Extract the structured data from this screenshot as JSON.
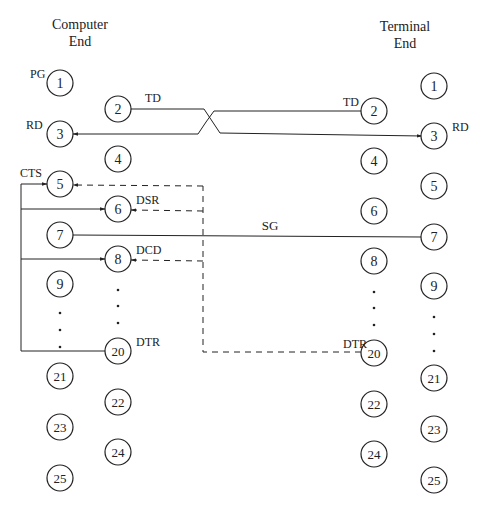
{
  "headers": {
    "computer": [
      "Computer",
      "End"
    ],
    "terminal": [
      "Terminal",
      "End"
    ]
  },
  "computer_pins": [
    {
      "n": "1",
      "x": 60,
      "y": 83,
      "label": "PG",
      "lx": 30,
      "ly": 78
    },
    {
      "n": "2",
      "x": 118,
      "y": 109,
      "label": "TD",
      "lx": 145,
      "ly": 102
    },
    {
      "n": "3",
      "x": 60,
      "y": 134,
      "label": "RD",
      "lx": 26,
      "ly": 129
    },
    {
      "n": "4",
      "x": 118,
      "y": 159,
      "label": "",
      "lx": 0,
      "ly": 0
    },
    {
      "n": "5",
      "x": 60,
      "y": 184,
      "label": "CTS",
      "lx": 20,
      "ly": 177
    },
    {
      "n": "6",
      "x": 118,
      "y": 209,
      "label": "DSR",
      "lx": 136,
      "ly": 204
    },
    {
      "n": "7",
      "x": 60,
      "y": 235,
      "label": "",
      "lx": 0,
      "ly": 0
    },
    {
      "n": "8",
      "x": 118,
      "y": 259,
      "label": "DCD",
      "lx": 136,
      "ly": 254
    },
    {
      "n": "9",
      "x": 60,
      "y": 284,
      "label": "",
      "lx": 0,
      "ly": 0
    },
    {
      "n": "20",
      "x": 118,
      "y": 351,
      "label": "DTR",
      "lx": 136,
      "ly": 346
    },
    {
      "n": "21",
      "x": 60,
      "y": 376,
      "label": "",
      "lx": 0,
      "ly": 0
    },
    {
      "n": "22",
      "x": 118,
      "y": 402,
      "label": "",
      "lx": 0,
      "ly": 0
    },
    {
      "n": "23",
      "x": 60,
      "y": 427,
      "label": "",
      "lx": 0,
      "ly": 0
    },
    {
      "n": "24",
      "x": 118,
      "y": 452,
      "label": "",
      "lx": 0,
      "ly": 0
    },
    {
      "n": "25",
      "x": 60,
      "y": 478,
      "label": "",
      "lx": 0,
      "ly": 0
    }
  ],
  "terminal_pins": [
    {
      "n": "1",
      "x": 434,
      "y": 86,
      "label": "",
      "lx": 0,
      "ly": 0
    },
    {
      "n": "2",
      "x": 374,
      "y": 111,
      "label": "TD",
      "lx": 343,
      "ly": 106
    },
    {
      "n": "3",
      "x": 434,
      "y": 136,
      "label": "RD",
      "lx": 452,
      "ly": 131
    },
    {
      "n": "4",
      "x": 374,
      "y": 161,
      "label": "",
      "lx": 0,
      "ly": 0
    },
    {
      "n": "5",
      "x": 434,
      "y": 186,
      "label": "",
      "lx": 0,
      "ly": 0
    },
    {
      "n": "6",
      "x": 374,
      "y": 211,
      "label": "",
      "lx": 0,
      "ly": 0
    },
    {
      "n": "7",
      "x": 434,
      "y": 237,
      "label": "",
      "lx": 0,
      "ly": 0
    },
    {
      "n": "8",
      "x": 374,
      "y": 261,
      "label": "",
      "lx": 0,
      "ly": 0
    },
    {
      "n": "9",
      "x": 434,
      "y": 286,
      "label": "",
      "lx": 0,
      "ly": 0
    },
    {
      "n": "20",
      "x": 374,
      "y": 353,
      "label": "DTR",
      "lx": 343,
      "ly": 348
    },
    {
      "n": "21",
      "x": 434,
      "y": 378,
      "label": "",
      "lx": 0,
      "ly": 0
    },
    {
      "n": "22",
      "x": 374,
      "y": 404,
      "label": "",
      "lx": 0,
      "ly": 0
    },
    {
      "n": "23",
      "x": 434,
      "y": 429,
      "label": "",
      "lx": 0,
      "ly": 0
    },
    {
      "n": "24",
      "x": 374,
      "y": 454,
      "label": "",
      "lx": 0,
      "ly": 0
    },
    {
      "n": "25",
      "x": 434,
      "y": 480,
      "label": "",
      "lx": 0,
      "ly": 0
    }
  ],
  "signals": {
    "sg_label": "SG"
  },
  "ellipsis": {
    "computer_outer": [
      {
        "x": 60,
        "y": 313
      },
      {
        "x": 60,
        "y": 330
      },
      {
        "x": 60,
        "y": 347
      }
    ],
    "computer_inner": [
      {
        "x": 118,
        "y": 290
      },
      {
        "x": 118,
        "y": 306
      },
      {
        "x": 118,
        "y": 323
      }
    ],
    "terminal_inner": [
      {
        "x": 374,
        "y": 292
      },
      {
        "x": 374,
        "y": 308
      },
      {
        "x": 374,
        "y": 325
      }
    ],
    "terminal_outer": [
      {
        "x": 434,
        "y": 317
      },
      {
        "x": 434,
        "y": 334
      },
      {
        "x": 434,
        "y": 351
      }
    ]
  },
  "colors": {
    "stroke": "#222222",
    "background": "#ffffff"
  }
}
